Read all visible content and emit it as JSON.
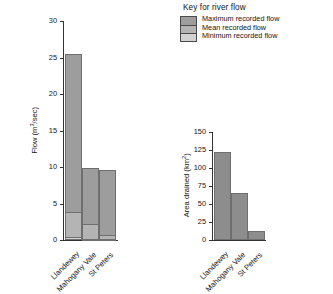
{
  "legend": {
    "title": "Key for river flow",
    "items": [
      {
        "label": "Maximum recorded flow",
        "color": "#9d9d9d"
      },
      {
        "label": "Mean recorded flow",
        "color": "#b4b4b4"
      },
      {
        "label": "Minimum recorded flow",
        "color": "#d2d2d2"
      }
    ]
  },
  "chart_data": [
    {
      "id": "river-flow",
      "type": "bar",
      "stacked": true,
      "title": "",
      "xlabel": "",
      "ylabel": "Flow (m3/sec)",
      "ylabel_base": "Flow (m",
      "ylabel_sup": "3",
      "ylabel_tail": "/sec)",
      "ylim": [
        0,
        30
      ],
      "yticks": [
        0,
        5,
        10,
        15,
        20,
        25,
        30
      ],
      "ytick_labels": [
        "0",
        "5",
        "10",
        "15",
        "20",
        "25",
        "30"
      ],
      "grid": false,
      "legend_position": "top-right",
      "categories": [
        "Llandewey",
        "Mahogany Vale",
        "St Peters"
      ],
      "series": [
        {
          "name": "Maximum recorded flow",
          "values": [
            25.5,
            9.9,
            9.6
          ]
        },
        {
          "name": "Mean recorded flow",
          "values": [
            3.9,
            2.2,
            0.7
          ]
        },
        {
          "name": "Minimum recorded flow",
          "values": [
            0.35,
            0.15,
            0.1
          ]
        }
      ]
    },
    {
      "id": "area-drained",
      "type": "bar",
      "stacked": false,
      "title": "",
      "xlabel": "",
      "ylabel": "Area drained (km2)",
      "ylabel_base": "Area drained (km",
      "ylabel_sup": "2",
      "ylabel_tail": ")",
      "ylim": [
        0,
        150
      ],
      "yticks": [
        0,
        25,
        50,
        75,
        100,
        125,
        150
      ],
      "ytick_labels": [
        "0",
        "25",
        "50",
        "75",
        "100",
        "125",
        "150"
      ],
      "grid": false,
      "legend_position": "none",
      "categories": [
        "Llandewey",
        "Mahogany Vale",
        "St Peters"
      ],
      "values": [
        122,
        65,
        13
      ],
      "bar_color": "#8d8d8d"
    }
  ]
}
